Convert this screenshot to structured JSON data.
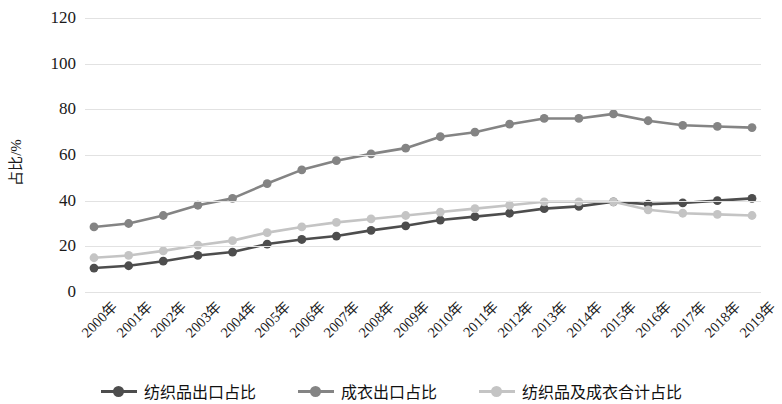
{
  "chart_data": {
    "type": "line",
    "title": "",
    "xlabel": "",
    "ylabel": "占比/%",
    "ylim": [
      0,
      120
    ],
    "ytick_labels": [
      "0",
      "20",
      "40",
      "60",
      "80",
      "100",
      "120"
    ],
    "ytick_values": [
      0,
      20,
      40,
      60,
      80,
      100,
      120
    ],
    "grid": true,
    "legend_position": "bottom",
    "categories": [
      "2000年",
      "2001年",
      "2002年",
      "2003年",
      "2004年",
      "2005年",
      "2006年",
      "2007年",
      "2008年",
      "2009年",
      "2010年",
      "2011年",
      "2012年",
      "2013年",
      "2014年",
      "2015年",
      "2016年",
      "2017年",
      "2018年",
      "2019年"
    ],
    "series": [
      {
        "name": "纺织品出口占比",
        "color": "#4d4d4d",
        "values": [
          10.5,
          11.5,
          13.5,
          16,
          17.5,
          21,
          23,
          24.5,
          27,
          29,
          31.5,
          33,
          34.5,
          36.5,
          37.5,
          39.5,
          38.5,
          39,
          40,
          41
        ]
      },
      {
        "name": "成衣出口占比",
        "color": "#848484",
        "values": [
          28.5,
          30,
          33.5,
          38,
          41,
          47.5,
          53.5,
          57.5,
          60.5,
          63,
          68,
          70,
          73.5,
          76,
          76,
          78,
          75,
          73,
          72.5,
          72
        ]
      },
      {
        "name": "纺织品及成衣合计占比",
        "color": "#c4c4c4",
        "values": [
          15,
          16,
          18,
          20.5,
          22.5,
          26,
          28.5,
          30.5,
          32,
          33.5,
          35,
          36.5,
          38,
          39.5,
          39.5,
          39.5,
          36,
          34.5,
          34,
          33.5
        ]
      }
    ]
  },
  "legend": {
    "items": [
      {
        "label": "纺织品出口占比",
        "color": "#4d4d4d"
      },
      {
        "label": "成衣出口占比",
        "color": "#848484"
      },
      {
        "label": "纺织品及成衣合计占比",
        "color": "#c4c4c4"
      }
    ]
  }
}
